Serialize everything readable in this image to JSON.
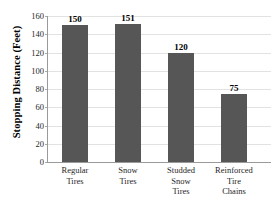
{
  "chart_data": {
    "type": "bar",
    "title": "",
    "xlabel": "",
    "ylabel": "Stopping Distance (Feet)",
    "categories": [
      "Regular Tires",
      "Snow Tires",
      "Studded Snow Tires",
      "Reinforced Tire Chains"
    ],
    "category_lines": [
      [
        "Regular",
        "Tires"
      ],
      [
        "Snow",
        "Tires"
      ],
      [
        "Studded",
        "Snow",
        "Tires"
      ],
      [
        "Reinforced",
        "Tire",
        "Chains"
      ]
    ],
    "values": [
      150,
      151,
      120,
      75
    ],
    "value_labels": [
      "150",
      "151",
      "120",
      "75"
    ],
    "ylim": [
      0,
      160
    ],
    "ytick_step": 20,
    "yticks": [
      160,
      140,
      120,
      100,
      80,
      60,
      40,
      20,
      0
    ],
    "ytick_labels": [
      "160",
      "140",
      "120",
      "100",
      "80",
      "60",
      "40",
      "20",
      "0"
    ],
    "grid": true,
    "grid_axis": "y",
    "legend": false,
    "legend_position": "none",
    "series": [
      {
        "name": "Stopping Distance",
        "values": [
          150,
          151,
          120,
          75
        ]
      }
    ]
  },
  "style": {
    "bar_color": "#565656",
    "grid_color": "#e2e2e2",
    "axis_color": "#9a9a9a",
    "text_color": "#1f1f1f",
    "background": "#ffffff"
  }
}
